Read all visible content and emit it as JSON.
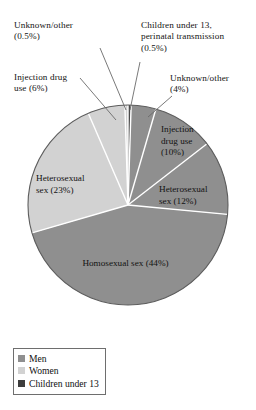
{
  "chart_data": {
    "type": "pie",
    "title": "",
    "total_percent": 100,
    "legend_position": "bottom-left",
    "groups": [
      {
        "name": "Men",
        "color": "#8f8f8f"
      },
      {
        "name": "Women",
        "color": "#d2d2d2"
      },
      {
        "name": "Children under 13",
        "color": "#4a4a4a"
      }
    ],
    "categories": [
      "Children under 13, perinatal transmission",
      "Unknown/other (men)",
      "Injection drug use (men)",
      "Heterosexual sex (men)",
      "Homosexual sex (men)",
      "Heterosexual sex (women)",
      "Injection drug use (women)",
      "Unknown/other (women)"
    ],
    "values": [
      0.5,
      4,
      10,
      12,
      44,
      23,
      6,
      0.5
    ],
    "slices": [
      {
        "key": "children",
        "label": "Children under 13, perinatal transmission",
        "value": 0.5,
        "group": "Children under 13",
        "color": "#4a4a4a"
      },
      {
        "key": "unknown_men",
        "label": "Unknown/other",
        "value": 4,
        "group": "Men",
        "color": "#8f8f8f"
      },
      {
        "key": "idu_men",
        "label": "Injection drug use",
        "value": 10,
        "group": "Men",
        "color": "#8f8f8f"
      },
      {
        "key": "het_men",
        "label": "Heterosexual sex",
        "value": 12,
        "group": "Men",
        "color": "#8f8f8f"
      },
      {
        "key": "homo_men",
        "label": "Homosexual sex",
        "value": 44,
        "group": "Men",
        "color": "#8f8f8f"
      },
      {
        "key": "het_women",
        "label": "Heterosexual sex",
        "value": 23,
        "group": "Women",
        "color": "#d2d2d2"
      },
      {
        "key": "idu_women",
        "label": "Injection drug use",
        "value": 6,
        "group": "Women",
        "color": "#d2d2d2"
      },
      {
        "key": "unknown_women",
        "label": "Unknown/other",
        "value": 0.5,
        "group": "Women",
        "color": "#d2d2d2"
      }
    ]
  },
  "callouts": {
    "unknown_women": "Unknown/other\n(0.5%)",
    "children": "Children under 13,\nperinatal transmission\n(0.5%)",
    "idu_women": "Injection drug\nuse (6%)",
    "unknown_men": "Unknown/other\n(4%)"
  },
  "slice_labels": {
    "idu_men": "Injection\ndrug use\n(10%)",
    "het_men": "Heterosexual\nsex (12%)",
    "het_women": "Heterosexual\nsex (23%)",
    "homo_men": "Homosexual sex (44%)"
  },
  "legend": {
    "items": [
      {
        "label": "Men",
        "color": "#8f8f8f"
      },
      {
        "label": "Women",
        "color": "#d2d2d2"
      },
      {
        "label": "Children under 13",
        "color": "#3d3d3d"
      }
    ]
  },
  "colors": {
    "men": "#8f8f8f",
    "women": "#d2d2d2",
    "children": "#4a4a4a",
    "separator": "#ffffff",
    "outline": "#4f4f4f",
    "leader_line": "#5a5a5a",
    "text": "#141414",
    "background": "#ffffff"
  }
}
